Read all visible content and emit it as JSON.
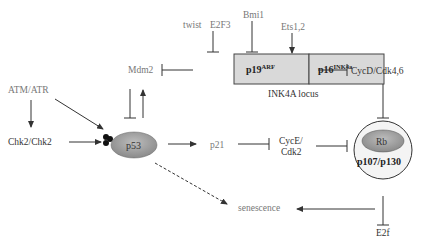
{
  "diagram": {
    "nodes": {
      "twist": "twist",
      "e2f3": "E2F3",
      "bmi1": "Bmi1",
      "ets": "Ets1,2",
      "p19": "p19",
      "p19_sup": "ARF",
      "p16": "p16",
      "p16_sup": "INK4a",
      "locus": "INK4A locus",
      "mdm2": "Mdm2",
      "cycd": "CycD/Cdk4,6",
      "atm": "ATM/ATR",
      "chk2": "Chk2/Chk2",
      "p53": "p53",
      "p21": "p21",
      "cyce1": "CycE/",
      "cyce2": "Cdk2",
      "rb": "Rb",
      "p107": "p107/p130",
      "senescence": "senescence",
      "e2f": "E2f"
    },
    "edges": [
      {
        "from": "twist/E2F3",
        "to": "p19ARF",
        "type": "inhibit"
      },
      {
        "from": "Bmi1",
        "to": "INK4A locus",
        "type": "inhibit"
      },
      {
        "from": "Ets1,2",
        "to": "p16INK4a",
        "type": "activate"
      },
      {
        "from": "p19ARF",
        "to": "Mdm2",
        "type": "inhibit"
      },
      {
        "from": "p16INK4a",
        "to": "CycD/Cdk4,6",
        "type": "inhibit"
      },
      {
        "from": "Mdm2",
        "to": "p53",
        "type": "inhibit"
      },
      {
        "from": "p53",
        "to": "Mdm2",
        "type": "activate"
      },
      {
        "from": "ATM/ATR",
        "to": "Chk2/Chk2",
        "type": "activate"
      },
      {
        "from": "ATM/ATR",
        "to": "p53",
        "type": "activate"
      },
      {
        "from": "Chk2/Chk2",
        "to": "p53",
        "type": "activate"
      },
      {
        "from": "p53",
        "to": "p21",
        "type": "activate"
      },
      {
        "from": "p21",
        "to": "CycE/Cdk2",
        "type": "inhibit"
      },
      {
        "from": "CycE/Cdk2",
        "to": "Rb",
        "type": "inhibit"
      },
      {
        "from": "CycD/Cdk4,6",
        "to": "Rb",
        "type": "inhibit"
      },
      {
        "from": "Rb",
        "to": "E2f",
        "type": "inhibit"
      },
      {
        "from": "Rb",
        "to": "senescence",
        "type": "activate"
      },
      {
        "from": "p53",
        "to": "senescence",
        "type": "activate-dashed"
      }
    ],
    "colors": {
      "box_fill": "#d9d9d9",
      "ellipse_fill": "#9a9a9a",
      "line": "#333333",
      "grey_text": "#777777"
    }
  }
}
